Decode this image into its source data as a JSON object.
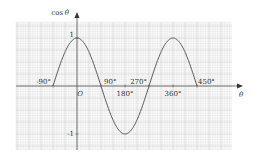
{
  "chart_data": {
    "type": "line",
    "title": "",
    "xlabel": "θ",
    "ylabel": "cos θ",
    "function": "cos θ",
    "x_range_deg": [
      -90,
      450
    ],
    "xlim_deg": [
      -135,
      540
    ],
    "ylim": [
      -1.25,
      1.5
    ],
    "grid": true,
    "x_tick_labels": [
      "-90°",
      "90°",
      "180°",
      "270°",
      "360°",
      "450°"
    ],
    "y_tick_labels": [
      "1",
      "-1"
    ],
    "origin_label": "O",
    "points": [
      {
        "x": -90,
        "y": 0
      },
      {
        "x": 0,
        "y": 1
      },
      {
        "x": 90,
        "y": 0
      },
      {
        "x": 180,
        "y": -1
      },
      {
        "x": 270,
        "y": 0
      },
      {
        "x": 360,
        "y": 1
      },
      {
        "x": 450,
        "y": 0
      }
    ],
    "colors": {
      "curve": "#555555",
      "grid": "#d9d9d9",
      "axis": "#555555"
    }
  }
}
